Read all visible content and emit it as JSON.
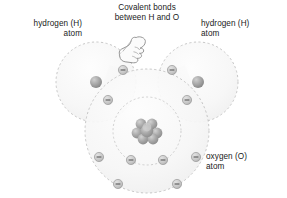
{
  "diagram": {
    "background_color": "#ffffff",
    "labels": {
      "hydrogen_left": "hydrogen (H)\natom",
      "covalent": "Covalent bonds\nbetween H and O",
      "hydrogen_right": "hydrogen (H)\natom",
      "oxygen": "oxygen (O)\natom"
    },
    "colors": {
      "text": "#1b1b1b",
      "orbit_dash": "#b9b9b9",
      "shell_fill": "#f4f4f4",
      "electron_fill": "#c8c8c8",
      "electron_stroke": "#9a9a9a",
      "electron_sign": "#4a4a4a",
      "nucleus_grey": "#9e9e9e",
      "nucleus_dark": "#8a8a8a",
      "bond_shade": "#ebebeb",
      "hand_outline": "#8f8f8f"
    },
    "atoms": [
      {
        "name": "hydrogen-left",
        "element": "H",
        "center": [
          96,
          82
        ],
        "shell_radius": 40,
        "nucleus_radius": 6,
        "electron_count": 2
      },
      {
        "name": "hydrogen-right",
        "element": "H",
        "center": [
          198,
          82
        ],
        "shell_radius": 40,
        "nucleus_radius": 6,
        "electron_count": 2
      },
      {
        "name": "oxygen",
        "element": "O",
        "center": [
          147,
          131
        ],
        "inner_shell_radius": 34,
        "outer_shell_radius": 62,
        "nucleus_radius": 13,
        "inner_electron_count": 2,
        "outer_electron_count": 8
      }
    ],
    "electrons": {
      "symbol": "−",
      "radius": 4.6,
      "hydrogen_left": [
        [
          123,
          70
        ],
        [
          108,
          100
        ]
      ],
      "hydrogen_right": [
        [
          172,
          70
        ],
        [
          187,
          100
        ]
      ],
      "oxygen_inner": [
        [
          131,
          160
        ],
        [
          163,
          160
        ]
      ],
      "oxygen_outer": [
        [
          123,
          70
        ],
        [
          172,
          70
        ],
        [
          108,
          100
        ],
        [
          187,
          100
        ],
        [
          99,
          157
        ],
        [
          196,
          157
        ],
        [
          118,
          184
        ],
        [
          177,
          184
        ]
      ]
    },
    "bonds": [
      {
        "name": "bond-left",
        "from": "hydrogen-left",
        "to": "oxygen"
      },
      {
        "name": "bond-right",
        "from": "hydrogen-right",
        "to": "oxygen"
      }
    ],
    "cursor": {
      "name": "pointing-hand-cursor",
      "x": 132,
      "y": 33,
      "points_to": "bond-left"
    }
  }
}
